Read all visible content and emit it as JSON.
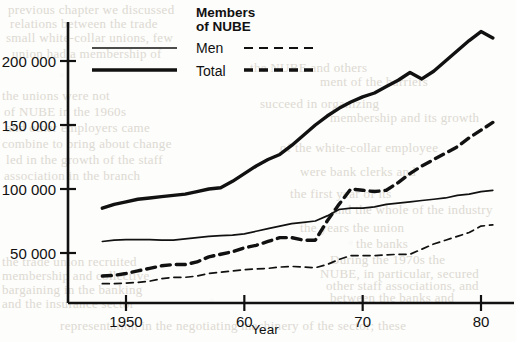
{
  "chart_data": {
    "type": "line",
    "title": "",
    "xlabel": "Year",
    "ylabel": "",
    "legend_title_line1": "Members",
    "legend_title_line2": "of NUBE",
    "legend_position": "top-center",
    "grid": false,
    "xlim": [
      1948,
      1981
    ],
    "ylim": [
      0,
      235000
    ],
    "xticks": [
      1950,
      1960,
      1970,
      1980
    ],
    "xticklabels": [
      "1950",
      "60",
      "70",
      "80"
    ],
    "yticks": [
      50000,
      100000,
      150000,
      200000
    ],
    "yticklabels": [
      "50 000",
      "100 000",
      "150 000",
      "200 000"
    ],
    "x": [
      1948,
      1949,
      1950,
      1951,
      1952,
      1953,
      1954,
      1955,
      1956,
      1957,
      1958,
      1959,
      1960,
      1961,
      1962,
      1963,
      1964,
      1965,
      1966,
      1967,
      1968,
      1969,
      1970,
      1971,
      1972,
      1973,
      1974,
      1975,
      1976,
      1977,
      1978,
      1979,
      1980,
      1981
    ],
    "series": [
      {
        "name": "Total",
        "style": "solid",
        "width": "thick",
        "values": [
          85000,
          88000,
          90000,
          92000,
          93000,
          94000,
          95000,
          96000,
          98000,
          100000,
          101000,
          106000,
          112000,
          118000,
          123000,
          127000,
          134000,
          142000,
          150000,
          157000,
          163000,
          168000,
          172000,
          175000,
          180000,
          185000,
          191000,
          186000,
          192000,
          200000,
          208000,
          216000,
          223000,
          218000
        ]
      },
      {
        "name": "Men",
        "style": "solid",
        "width": "thin",
        "values": [
          59000,
          60000,
          60500,
          60500,
          60500,
          60000,
          60000,
          61000,
          62000,
          63000,
          63500,
          64000,
          65000,
          67000,
          69000,
          71000,
          73000,
          74000,
          75000,
          79000,
          84000,
          85000,
          85000,
          86000,
          88000,
          89000,
          90000,
          91000,
          92000,
          93000,
          95000,
          96000,
          98000,
          99000
        ]
      },
      {
        "name": "Total (NUBE members)",
        "style": "dashed",
        "width": "thick",
        "values": [
          32000,
          32500,
          34000,
          36000,
          38000,
          40000,
          41000,
          41000,
          43000,
          47000,
          49000,
          51000,
          54000,
          56000,
          59000,
          62000,
          62000,
          60000,
          60000,
          75000,
          88000,
          100000,
          99000,
          98000,
          99000,
          105000,
          112000,
          118000,
          123000,
          128000,
          133000,
          140000,
          146000,
          152000
        ]
      },
      {
        "name": "Men (NUBE members)",
        "style": "dashed",
        "width": "thin",
        "values": [
          26000,
          26000,
          26500,
          27000,
          28000,
          30000,
          31000,
          31000,
          32000,
          34000,
          35000,
          36000,
          37000,
          37500,
          38000,
          39000,
          39500,
          39000,
          38500,
          41000,
          45000,
          48000,
          48000,
          48000,
          48500,
          49000,
          49000,
          53000,
          57000,
          60000,
          63000,
          66000,
          71000,
          72000
        ]
      }
    ],
    "legend_entries": [
      {
        "label": "Men",
        "solid_width": "thin",
        "dashed_width": "thin"
      },
      {
        "label": "Total",
        "solid_width": "thick",
        "dashed_width": "thick"
      }
    ]
  },
  "bleed_text": [
    {
      "t": "previous chapter we discussed",
      "x": 8,
      "y": 2
    },
    {
      "t": "relations between the trade",
      "x": 10,
      "y": 16
    },
    {
      "t": "small white-collar unions, few",
      "x": 6,
      "y": 30
    },
    {
      "t": "union had a membership of",
      "x": 12,
      "y": 46
    },
    {
      "t": "the NUBE and others",
      "x": 250,
      "y": 60
    },
    {
      "t": "ment of the barriers",
      "x": 320,
      "y": 74
    },
    {
      "t": "the unions were not",
      "x": 2,
      "y": 88
    },
    {
      "t": "succeed in organizing",
      "x": 260,
      "y": 96
    },
    {
      "t": "of NUBE in the 1960s",
      "x": 4,
      "y": 104
    },
    {
      "t": "membership and its growth",
      "x": 330,
      "y": 110
    },
    {
      "t": "and other employers came",
      "x": 6,
      "y": 120
    },
    {
      "t": "combine to bring about change",
      "x": 2,
      "y": 136
    },
    {
      "t": "of the white-collar employee",
      "x": 280,
      "y": 140
    },
    {
      "t": "led in the growth of the staff",
      "x": 6,
      "y": 152
    },
    {
      "t": "were bank clerks and",
      "x": 300,
      "y": 164
    },
    {
      "t": "association in the branch",
      "x": 4,
      "y": 168
    },
    {
      "t": "the first year of its",
      "x": 290,
      "y": 186
    },
    {
      "t": "and the whole of the industry",
      "x": 332,
      "y": 202
    },
    {
      "t": "the years the union",
      "x": 300,
      "y": 220
    },
    {
      "t": "the banks",
      "x": 356,
      "y": 236
    },
    {
      "t": "During the 1970s the",
      "x": 330,
      "y": 252
    },
    {
      "t": "the trade union recruited",
      "x": 2,
      "y": 254
    },
    {
      "t": "NUBE, in particular, secured",
      "x": 320,
      "y": 266
    },
    {
      "t": "membership and collective",
      "x": 2,
      "y": 268
    },
    {
      "t": "other staff associations, and",
      "x": 326,
      "y": 278
    },
    {
      "t": "bargaining in the banking",
      "x": 2,
      "y": 282
    },
    {
      "t": "between the banks and",
      "x": 330,
      "y": 290
    },
    {
      "t": "and the insurance sector",
      "x": 2,
      "y": 296
    },
    {
      "t": "representation in the negotiating machinery of the sector; these",
      "x": 60,
      "y": 318
    }
  ]
}
